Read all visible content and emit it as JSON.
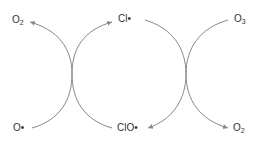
{
  "diagram": {
    "type": "ozone depletion catalytic cycle",
    "colors": {
      "arrow": "#888888",
      "text": "#333333",
      "background": "#ffffff"
    },
    "species": {
      "o2_top_left": {
        "base": "O",
        "sub": "2"
      },
      "cl_radical_top": {
        "text": "Cl•"
      },
      "o3_top_right": {
        "base": "O",
        "sub": "3"
      },
      "o_radical_bottom_left": {
        "text": "O•"
      },
      "clo_radical_bottom": {
        "text": "ClO•"
      },
      "o2_bottom_right": {
        "base": "O",
        "sub": "2"
      }
    },
    "arrows": [
      {
        "from": "o_radical_bottom_left",
        "to": "o2_top_left"
      },
      {
        "from": "clo_radical_bottom",
        "to": "cl_radical_top"
      },
      {
        "from": "cl_radical_top",
        "to": "clo_radical_bottom"
      },
      {
        "from": "o3_top_right",
        "to": "o2_bottom_right"
      }
    ]
  }
}
